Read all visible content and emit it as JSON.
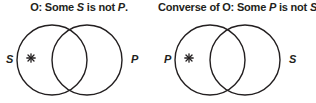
{
  "figure": {
    "name": "venn-diagram-pair-o-proposition",
    "background_color": "#ffffff",
    "stroke_color": "#231f20",
    "text_color": "#231f20"
  },
  "diagrams": [
    {
      "id": "o-proposition",
      "caption": {
        "prefix": "O:  Some ",
        "subject": "S",
        "middle": " is not ",
        "predicate": "P",
        "suffix": "."
      },
      "left_label": "S",
      "right_label": "P",
      "mark": "✳",
      "mark_region": "left-circle-only",
      "left_circle": {
        "cx": 52,
        "cy": 43,
        "r": 35
      },
      "right_circle": {
        "cx": 87,
        "cy": 43,
        "r": 35
      }
    },
    {
      "id": "converse-of-o-proposition",
      "caption": {
        "prefix": "Converse of O:  Some ",
        "subject": "P",
        "middle": " is not ",
        "predicate": "S",
        "suffix": "."
      },
      "left_label": "P",
      "right_label": "S",
      "mark": "✳",
      "mark_region": "left-circle-only",
      "left_circle": {
        "cx": 52,
        "cy": 43,
        "r": 35
      },
      "right_circle": {
        "cx": 87,
        "cy": 43,
        "r": 35
      }
    }
  ]
}
